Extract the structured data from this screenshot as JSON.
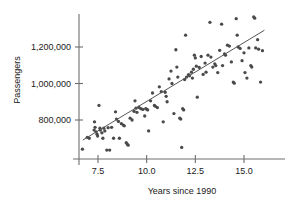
{
  "chart_data": {
    "type": "scatter",
    "title": "",
    "xlabel": "Years since 1990",
    "ylabel": "Passengers",
    "xlim": [
      6.55,
      16.3
    ],
    "ylim": [
      620000,
      1400000
    ],
    "grid": false,
    "legend": null,
    "xticks": [
      7.5,
      10.0,
      12.5,
      15.0
    ],
    "xtick_labels": [
      "7.5",
      "10.0",
      "12.5",
      "15.0"
    ],
    "yticks": [
      800000,
      1000000,
      1200000
    ],
    "ytick_labels": [
      "800,000",
      "1,000,000",
      "1,200,000"
    ],
    "point_color": "#4a4a4a",
    "line_color": "#555555",
    "axis_color": "#6e6e6e",
    "trend_line": {
      "name": "least-squares regression line",
      "x_start": 6.72,
      "y_start": 690000,
      "x_end": 16.05,
      "y_end": 1292000
    },
    "series": [
      {
        "name": "Passengers",
        "points": [
          [
            6.7,
            640000
          ],
          [
            6.95,
            705000
          ],
          [
            7.05,
            700000
          ],
          [
            7.3,
            745000
          ],
          [
            7.32,
            790000
          ],
          [
            7.35,
            760000
          ],
          [
            7.4,
            735000
          ],
          [
            7.45,
            722000
          ],
          [
            7.48,
            712000
          ],
          [
            7.55,
            880000
          ],
          [
            7.6,
            755000
          ],
          [
            7.62,
            745000
          ],
          [
            7.7,
            730000
          ],
          [
            7.75,
            700000
          ],
          [
            7.8,
            755000
          ],
          [
            7.85,
            740000
          ],
          [
            7.95,
            635000
          ],
          [
            8.02,
            758000
          ],
          [
            8.1,
            635000
          ],
          [
            8.2,
            760000
          ],
          [
            8.3,
            700000
          ],
          [
            8.4,
            845000
          ],
          [
            8.45,
            805000
          ],
          [
            8.55,
            792000
          ],
          [
            8.6,
            700000
          ],
          [
            8.7,
            780000
          ],
          [
            8.8,
            772000
          ],
          [
            8.85,
            768000
          ],
          [
            8.95,
            676000
          ],
          [
            9.0,
            668000
          ],
          [
            9.05,
            662000
          ],
          [
            9.15,
            810000
          ],
          [
            9.25,
            800000
          ],
          [
            9.35,
            848000
          ],
          [
            9.4,
            905000
          ],
          [
            9.45,
            865000
          ],
          [
            9.5,
            842000
          ],
          [
            9.6,
            870000
          ],
          [
            9.7,
            862000
          ],
          [
            9.8,
            858000
          ],
          [
            9.9,
            822000
          ],
          [
            9.95,
            862000
          ],
          [
            10.0,
            860000
          ],
          [
            10.05,
            855000
          ],
          [
            10.1,
            740000
          ],
          [
            10.2,
            905000
          ],
          [
            10.3,
            948000
          ],
          [
            10.4,
            880000
          ],
          [
            10.45,
            875000
          ],
          [
            10.55,
            868000
          ],
          [
            10.65,
            982000
          ],
          [
            10.75,
            955000
          ],
          [
            10.85,
            790000
          ],
          [
            10.95,
            952000
          ],
          [
            11.0,
            930000
          ],
          [
            11.05,
            900000
          ],
          [
            11.15,
            1025000
          ],
          [
            11.25,
            1068000
          ],
          [
            11.3,
            1000000
          ],
          [
            11.4,
            835000
          ],
          [
            11.5,
            1185000
          ],
          [
            11.55,
            1090000
          ],
          [
            11.6,
            1035000
          ],
          [
            11.7,
            810000
          ],
          [
            11.75,
            805000
          ],
          [
            11.8,
            650000
          ],
          [
            11.85,
            862000
          ],
          [
            11.9,
            855000
          ],
          [
            11.95,
            1022000
          ],
          [
            12.0,
            1265000
          ],
          [
            12.05,
            1035000
          ],
          [
            12.15,
            1048000
          ],
          [
            12.2,
            1042000
          ],
          [
            12.3,
            1062000
          ],
          [
            12.35,
            1030000
          ],
          [
            12.4,
            1078000
          ],
          [
            12.45,
            1155000
          ],
          [
            12.5,
            1140000
          ],
          [
            12.55,
            1095000
          ],
          [
            12.6,
            925000
          ],
          [
            12.7,
            1088000
          ],
          [
            12.8,
            1148000
          ],
          [
            12.9,
            1050000
          ],
          [
            13.0,
            1112000
          ],
          [
            13.05,
            1062000
          ],
          [
            13.15,
            1155000
          ],
          [
            13.25,
            1335000
          ],
          [
            13.3,
            1145000
          ],
          [
            13.4,
            1090000
          ],
          [
            13.5,
            1108000
          ],
          [
            13.55,
            1098000
          ],
          [
            13.65,
            1060000
          ],
          [
            13.75,
            1182000
          ],
          [
            13.85,
            1325000
          ],
          [
            13.9,
            1098000
          ],
          [
            14.0,
            1162000
          ],
          [
            14.05,
            1155000
          ],
          [
            14.15,
            1210000
          ],
          [
            14.25,
            1205000
          ],
          [
            14.35,
            1118000
          ],
          [
            14.45,
            1008000
          ],
          [
            14.5,
            1002000
          ],
          [
            14.6,
            1355000
          ],
          [
            14.65,
            1265000
          ],
          [
            14.7,
            1200000
          ],
          [
            14.8,
            1192000
          ],
          [
            14.9,
            1125000
          ],
          [
            15.0,
            1168000
          ],
          [
            15.05,
            1060000
          ],
          [
            15.15,
            1030000
          ],
          [
            15.25,
            1195000
          ],
          [
            15.35,
            1098000
          ],
          [
            15.4,
            1090000
          ],
          [
            15.5,
            1365000
          ],
          [
            15.55,
            1358000
          ],
          [
            15.6,
            1195000
          ],
          [
            15.7,
            1240000
          ],
          [
            15.75,
            1188000
          ],
          [
            15.85,
            1008000
          ],
          [
            15.95,
            1180000
          ]
        ]
      }
    ]
  }
}
